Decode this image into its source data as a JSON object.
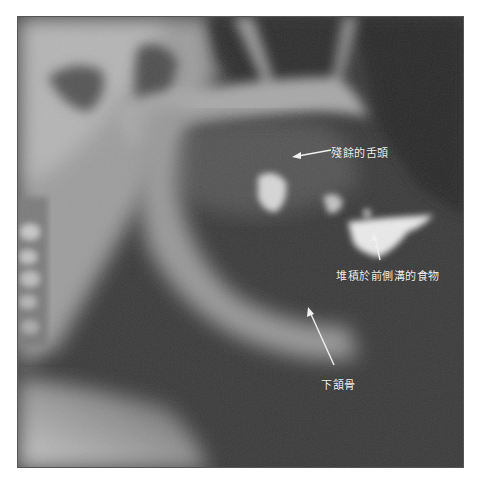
{
  "figure": {
    "type": "radiograph",
    "colors": {
      "background": "#ffffff",
      "border": "#555555",
      "label_text": "#f2f2f2",
      "arrow": "#f0f0f0"
    }
  },
  "annotations": [
    {
      "id": "residual-tongue",
      "text": "殘餘的舌頭",
      "arrow_direction": "left"
    },
    {
      "id": "food-anterior-sulcus",
      "text": "堆積於前側溝的食物",
      "arrow_direction": "up"
    },
    {
      "id": "mandible",
      "text": "下頷骨",
      "arrow_direction": "up-left"
    }
  ]
}
